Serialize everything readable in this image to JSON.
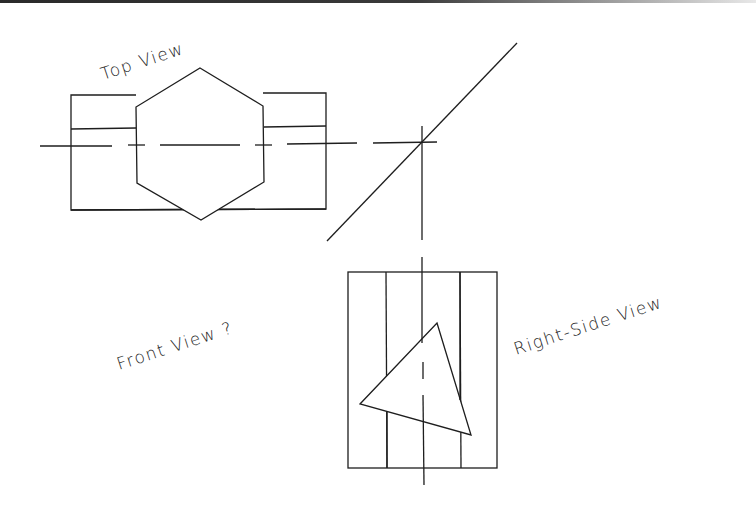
{
  "labels": {
    "top_view": "Top View",
    "front_view": "Front View ?",
    "right_side_view": "Right-Side View"
  },
  "colors": {
    "line": "#1e1e1e",
    "background": "#ffffff"
  },
  "drawing": {
    "type": "orthographic-projection-exercise",
    "views": [
      "Top View",
      "Right-Side View",
      "Front View ?"
    ],
    "top_view": {
      "rect": [
        71,
        94,
        326,
        210
      ],
      "hexagon": [
        [
          200,
          68
        ],
        [
          263,
          106
        ],
        [
          264,
          182
        ],
        [
          201,
          220
        ],
        [
          137,
          183
        ],
        [
          136,
          107
        ]
      ],
      "centerline_y": 144
    },
    "right_side_view": {
      "rect": [
        348,
        272,
        497,
        468
      ],
      "inner_lines_x": [
        386,
        460
      ],
      "triangle": [
        [
          437,
          323
        ],
        [
          471,
          435
        ],
        [
          360,
          404
        ]
      ],
      "centerline_x": 422
    },
    "miter_line": [
      [
        327,
        241
      ],
      [
        517,
        43
      ]
    ]
  }
}
